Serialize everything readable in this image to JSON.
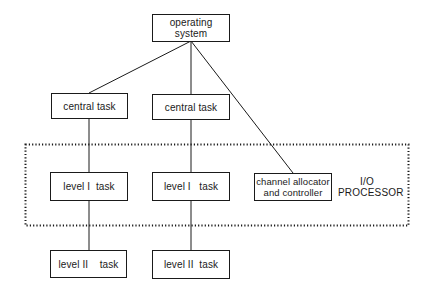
{
  "diagram": {
    "type": "hierarchy",
    "nodes": {
      "operating_system": {
        "label": "operating system"
      },
      "central_task_1": {
        "label": "central task"
      },
      "central_task_2": {
        "label": "central task"
      },
      "level1_task_1": {
        "label": "level I  task"
      },
      "level1_task_2": {
        "label": "level I   task"
      },
      "channel_allocator": {
        "line1": "channel allocator",
        "line2": "and controller"
      },
      "level2_task_1": {
        "label": "level II    task"
      },
      "level2_task_2": {
        "label": "level II  task"
      }
    },
    "region": {
      "name": "io-processor",
      "line1": "I/O",
      "line2": "PROCESSOR",
      "border_style": "dotted"
    },
    "edges": [
      {
        "from": "operating_system",
        "to": "central_task_1"
      },
      {
        "from": "operating_system",
        "to": "central_task_2"
      },
      {
        "from": "operating_system",
        "to": "channel_allocator"
      },
      {
        "from": "central_task_1",
        "to": "level1_task_1"
      },
      {
        "from": "central_task_2",
        "to": "level1_task_2"
      },
      {
        "from": "level1_task_1",
        "to": "level2_task_1"
      },
      {
        "from": "level1_task_2",
        "to": "level2_task_2"
      }
    ],
    "colors": {
      "line": "#1a1a1a",
      "background": "#ffffff"
    }
  }
}
